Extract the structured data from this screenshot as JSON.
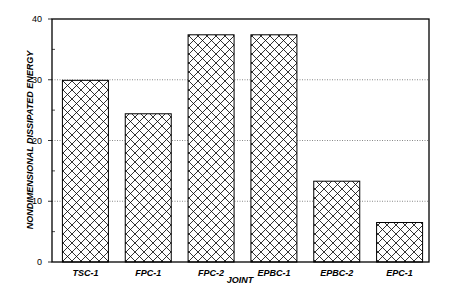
{
  "chart_data": {
    "type": "bar",
    "title": "",
    "xlabel": "JOINT",
    "ylabel": "NONDIMENSIONAL DISSIPATED ENERGY",
    "categories": [
      "TSC-1",
      "FPC-1",
      "FPC-2",
      "EPBC-1",
      "EPBC-2",
      "EPC-1"
    ],
    "values": [
      29.9,
      24.4,
      37.4,
      37.4,
      13.3,
      6.5
    ],
    "ylim": [
      0,
      40
    ],
    "yticks": [
      0,
      10,
      20,
      30,
      40
    ],
    "grid": "horizontal dotted at 10, 20, 30",
    "legend": null,
    "bar_fill": "crosshatch",
    "colors": {
      "bar_stroke": "#000000",
      "bar_fill_bg": "#ffffff",
      "grid": "#555555"
    }
  }
}
